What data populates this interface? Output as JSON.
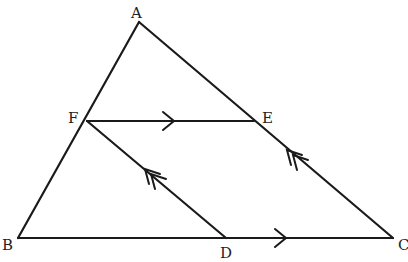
{
  "diagram": {
    "type": "geometry-triangle-parallel-lines",
    "points": {
      "A": {
        "label": "A",
        "x": 139,
        "y": 22
      },
      "B": {
        "label": "B",
        "x": 18,
        "y": 238
      },
      "C": {
        "label": "C",
        "x": 393,
        "y": 238
      },
      "D": {
        "label": "D",
        "x": 226,
        "y": 238
      },
      "E": {
        "label": "E",
        "x": 254,
        "y": 121
      },
      "F": {
        "label": "F",
        "x": 87,
        "y": 121
      }
    },
    "segments": [
      "AB",
      "AC",
      "BC",
      "FE",
      "FD"
    ],
    "parallel_marks": [
      {
        "segments": [
          "FE",
          "BC"
        ],
        "marker": "single-arrow"
      },
      {
        "segments": [
          "FD",
          "EC"
        ],
        "marker": "double-arrow"
      }
    ],
    "line_color": "#1a1a1a"
  }
}
